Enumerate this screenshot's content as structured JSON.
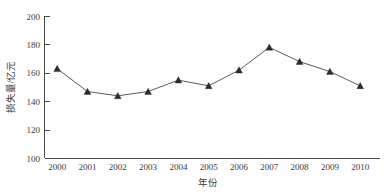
{
  "chart_data": {
    "type": "line",
    "title": "",
    "subtitle": "",
    "xlabel": "年份",
    "ylabel": "损失量/亿元",
    "categories": [
      "2000",
      "2001",
      "2002",
      "2003",
      "2004",
      "2005",
      "2006",
      "2007",
      "2008",
      "2009",
      "2010"
    ],
    "values": [
      163,
      147,
      144,
      147,
      155,
      151,
      162,
      178,
      168,
      161,
      151
    ],
    "series": [
      {
        "name": "损失量",
        "values": [
          163,
          147,
          144,
          147,
          155,
          151,
          162,
          178,
          168,
          161,
          151
        ]
      }
    ],
    "x": [
      2000,
      2001,
      2002,
      2003,
      2004,
      2005,
      2006,
      2007,
      2008,
      2009,
      2010
    ],
    "ylim": [
      100,
      200
    ],
    "xlim": [
      1999.5,
      2010.5
    ],
    "yticks": [
      100,
      120,
      140,
      160,
      180,
      200
    ],
    "ytick_labels": [
      "100",
      "120",
      "140",
      "160",
      "180",
      "200"
    ],
    "xtick_labels": [
      "2000",
      "2001",
      "2002",
      "2003",
      "2004",
      "2005",
      "2006",
      "2007",
      "2008",
      "2009",
      "2010"
    ],
    "grid": false,
    "legend": false,
    "legend_position": "none",
    "marker_style": "triangle-up",
    "line_color": "#5a5a5a",
    "marker_color": "#2b2b2b",
    "axis_color": "#4a4a4a",
    "background_color": "#ffffff",
    "annotations": []
  }
}
